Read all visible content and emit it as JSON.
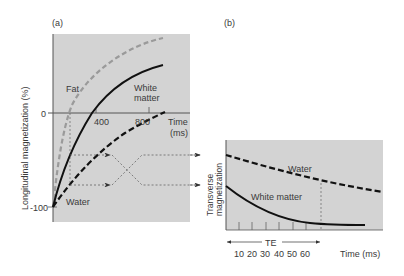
{
  "figure": {
    "panel_a": {
      "label": "(a)",
      "ylabel": "Longitudinal magnetization (%)",
      "yticks": [
        "0",
        "-100"
      ],
      "xticks": [
        "400",
        "800"
      ],
      "xlabel_line1": "Time",
      "xlabel_line2": "(ms)",
      "curves": {
        "fat": "Fat",
        "white_matter_line1": "White",
        "white_matter_line2": "matter",
        "water": "Water"
      }
    },
    "panel_b": {
      "label": "(b)",
      "ylabel_line1": "Transverse",
      "ylabel_line2": "magnetization",
      "curves": {
        "water": "Water",
        "white_matter": "White matter"
      },
      "te_label": "TE",
      "xticks": [
        "10",
        "20",
        "30",
        "40",
        "50",
        "60"
      ],
      "xlabel": "Time (ms)"
    },
    "colors": {
      "panel_bg": "#d3d3d3",
      "fat_curve": "#9a9a9a",
      "white_matter_curve": "#111111",
      "water_curve": "#111111",
      "guide_lines": "#666666"
    }
  }
}
